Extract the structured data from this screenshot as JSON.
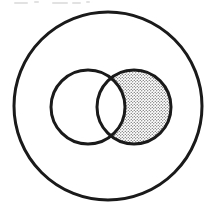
{
  "figure": {
    "type": "venn-euler-diagram",
    "caption": "",
    "background_color": "#ffffff",
    "stroke_color": "#1a1a1a",
    "fill_color": "#ffffff",
    "shade_color": "#4a4a4a",
    "shade_pattern": "stipple-dots",
    "canvas": {
      "width": 217,
      "height": 210
    }
  },
  "shapes": {
    "universe": {
      "label": "",
      "name": "outer-universal-set-circle",
      "cx": 108,
      "cy": 106,
      "r": 94,
      "stroke_width": 3,
      "filled": false
    },
    "set_left": {
      "label": "",
      "name": "left-set-circle",
      "cx": 88,
      "cy": 107,
      "r": 37,
      "stroke_width": 3,
      "filled": false
    },
    "set_right": {
      "label": "",
      "name": "right-set-circle",
      "cx": 134,
      "cy": 107,
      "r": 37,
      "stroke_width": 3,
      "filled": false
    }
  },
  "shaded_region": {
    "name": "right-set-minus-left-set",
    "description": "right circle excluding the overlap",
    "pattern": "stipple-dots",
    "dot_color": "#3d3d3d",
    "dot_spacing": 3,
    "dot_radius": 0.62
  },
  "intersection_points": {
    "top": {
      "x": 111,
      "y": 77
    },
    "bottom": {
      "x": 111,
      "y": 137
    }
  },
  "artifacts": {
    "top_edge_scan_remnants": "faint cut-off text remnants along the top edge"
  }
}
